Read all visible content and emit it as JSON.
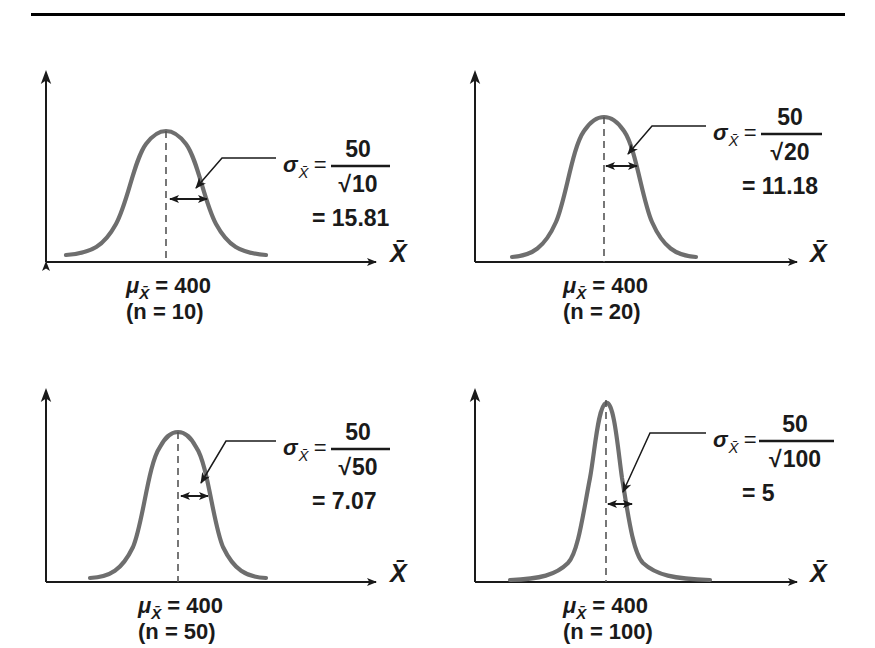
{
  "figure": {
    "rule_color": "#000000",
    "curve_color": "#6e6e6e",
    "axis_color": "#1a1a1a",
    "dash_color": "#555555",
    "background": "#ffffff"
  },
  "axis_label": "X̄",
  "sigma_symbol": "σ",
  "mu_symbol": "μ",
  "radical_symbol": "√",
  "equals": "=",
  "panels": [
    {
      "id": "panel-n10",
      "n": "10",
      "mu_label": "μ",
      "mu_sub": "X̄",
      "mu_value": "400",
      "mu_text": "= 400",
      "n_text": "(n  =  10)",
      "sigma_label": "σ",
      "sigma_sub": "X̄",
      "numerator": "50",
      "denominator": "10",
      "denominator_text": "√10",
      "result": "= 15.81",
      "result_value": "15.81",
      "x_axis_label": "X̄"
    },
    {
      "id": "panel-n20",
      "n": "20",
      "mu_label": "μ",
      "mu_sub": "X̄",
      "mu_value": "400",
      "mu_text": "= 400",
      "n_text": "(n  =  20)",
      "sigma_label": "σ",
      "sigma_sub": "X̄",
      "numerator": "50",
      "denominator": "20",
      "denominator_text": "√20",
      "result": "= 11.18",
      "result_value": "11.18",
      "x_axis_label": "X̄"
    },
    {
      "id": "panel-n50",
      "n": "50",
      "mu_label": "μ",
      "mu_sub": "X̄",
      "mu_value": "400",
      "mu_text": "= 400",
      "n_text": "(n  =  50)",
      "sigma_label": "σ",
      "sigma_sub": "X̄",
      "numerator": "50",
      "denominator": "50",
      "denominator_text": "√50",
      "result": "= 7.07",
      "result_value": "7.07",
      "x_axis_label": "X̄"
    },
    {
      "id": "panel-n100",
      "n": "100",
      "mu_label": "μ",
      "mu_sub": "X̄",
      "mu_value": "400",
      "mu_text": "= 400",
      "n_text": "(n  =  100)",
      "sigma_label": "σ",
      "sigma_sub": "X̄",
      "numerator": "50",
      "denominator": "100",
      "denominator_text": "√100",
      "result": "= 5",
      "result_value": "5",
      "x_axis_label": "X̄"
    }
  ],
  "chart_data": {
    "type": "line",
    "xlabel": "X̄",
    "ylabel": "",
    "grid": false,
    "legend": "none",
    "population_sigma": 50,
    "population_mean": 400,
    "series": [
      {
        "name": "n = 10",
        "mean": 400,
        "sample_size": 10,
        "standard_error": 15.81,
        "formula": "50 / √10",
        "panel": "top-left"
      },
      {
        "name": "n = 20",
        "mean": 400,
        "sample_size": 20,
        "standard_error": 11.18,
        "formula": "50 / √20",
        "panel": "top-right"
      },
      {
        "name": "n = 50",
        "mean": 400,
        "sample_size": 50,
        "standard_error": 7.07,
        "formula": "50 / √50",
        "panel": "bottom-left"
      },
      {
        "name": "n = 100",
        "mean": 400,
        "sample_size": 100,
        "standard_error": 5,
        "formula": "50 / √100",
        "panel": "bottom-right"
      }
    ]
  }
}
